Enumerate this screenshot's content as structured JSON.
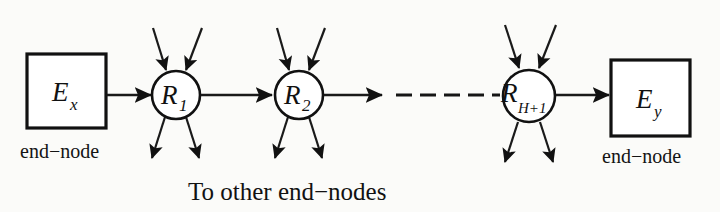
{
  "figure": {
    "type": "network-path-diagram",
    "background_color": "#fbfbf9",
    "ink_color": "#111111",
    "nodes": [
      {
        "id": "Ex",
        "shape": "rectangle",
        "label_main": "E",
        "label_sub": "x",
        "caption": "end−node"
      },
      {
        "id": "R1",
        "shape": "circle",
        "label_main": "R",
        "label_sub": "1",
        "caption": ""
      },
      {
        "id": "R2",
        "shape": "circle",
        "label_main": "R",
        "label_sub": "2",
        "caption": ""
      },
      {
        "id": "RH1",
        "shape": "circle",
        "label_main": "R",
        "label_sub": "H+1",
        "caption": ""
      },
      {
        "id": "Ey",
        "shape": "rectangle",
        "label_main": "E",
        "label_sub": "y",
        "caption": "end−node"
      }
    ],
    "links": [
      {
        "from": "Ex",
        "to": "R1",
        "style": "solid-arrow"
      },
      {
        "from": "R1",
        "to": "R2",
        "style": "solid-arrow"
      },
      {
        "from": "R2",
        "to": "RH1",
        "style": "dashed-continuation",
        "dash_count": 6
      },
      {
        "from": "RH1",
        "to": "Ey",
        "style": "solid-arrow"
      }
    ],
    "external_links": {
      "description": "two inbound arrows above and two outbound arrows below each router",
      "inbound_per_router": 2,
      "outbound_per_router": 2,
      "caption": "To other end−nodes"
    },
    "labels": {
      "left_end_node": "end−node",
      "right_end_node": "end−node",
      "bottom_caption": "To other end−nodes"
    }
  }
}
